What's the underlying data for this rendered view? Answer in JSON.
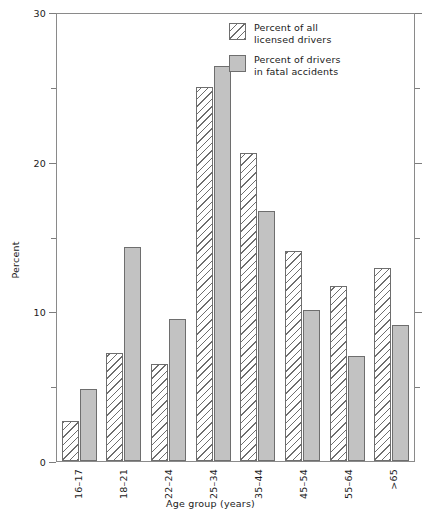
{
  "chart_data": {
    "type": "bar",
    "title": "",
    "xlabel": "Age group (years)",
    "ylabel": "Percent",
    "ylim": [
      0,
      30
    ],
    "yticks": [
      0,
      10,
      20,
      30
    ],
    "ytick_labels": [
      "0",
      "10",
      "20",
      "30"
    ],
    "yminor_ticks": [
      5,
      15,
      25
    ],
    "grid": false,
    "legend_position": "top-right",
    "categories": [
      "16–17",
      "18–21",
      "22–24",
      "25–34",
      "35–44",
      "45–54",
      "55–64",
      ">65"
    ],
    "series": [
      {
        "name": "Percent of all licensed drivers",
        "name_line1": "Percent of all",
        "name_line2": "licensed drivers",
        "pattern": "diagonal-hatch",
        "color": "#ffffff",
        "edge_color": "#6e6e6e",
        "values": [
          2.7,
          7.2,
          6.5,
          25.0,
          20.6,
          14.0,
          11.7,
          12.9
        ]
      },
      {
        "name": "Percent of drivers in fatal accidents",
        "name_line1": "Percent of drivers",
        "name_line2": "in fatal accidents",
        "pattern": "solid",
        "color": "#c2c2c2",
        "edge_color": "#6e6e6e",
        "values": [
          4.8,
          14.3,
          9.5,
          26.4,
          16.7,
          10.1,
          7.0,
          9.1
        ]
      }
    ]
  }
}
